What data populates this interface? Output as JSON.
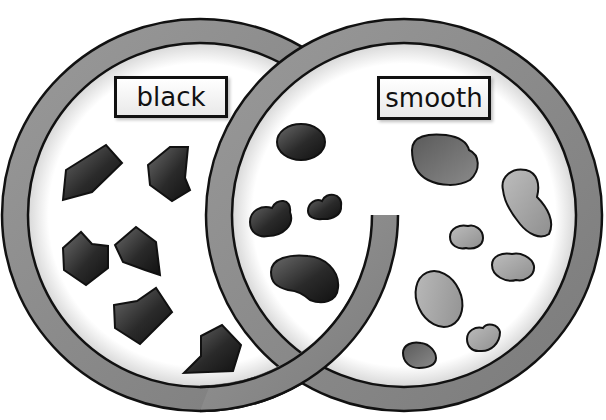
{
  "header": {
    "partial_text": ""
  },
  "venn": {
    "sets": [
      {
        "id": "left",
        "label": "black",
        "item_shape": "angular polygon",
        "item_color": "#2a2a2a"
      },
      {
        "id": "right",
        "label": "smooth",
        "item_shape": "rounded blob",
        "item_color": "#8a8a8a"
      }
    ],
    "regions": {
      "black_only": {
        "count": 7,
        "description": "black, not smooth (dark angular shapes)"
      },
      "both": {
        "count": 4,
        "description": "black and smooth (dark rounded blobs)"
      },
      "smooth_only": {
        "count": 8,
        "description": "smooth, not black (grey rounded blobs)"
      }
    },
    "colors": {
      "ring": "#8c8c8c",
      "ring_outline": "#111111",
      "inner": "#ffffff",
      "dark_item": "#2b2b2b",
      "mid_item": "#6e6e6e",
      "light_item": "#a8a8a8"
    }
  }
}
